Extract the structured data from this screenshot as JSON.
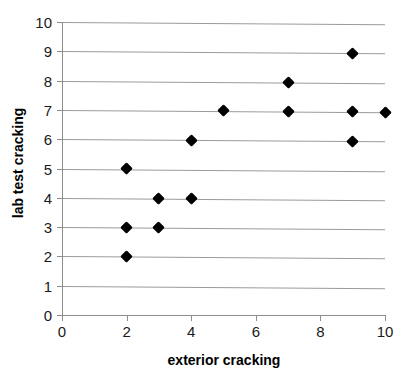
{
  "chart_data": {
    "type": "scatter",
    "title": "",
    "xlabel": "exterior cracking",
    "ylabel": "lab test cracking",
    "xlim": [
      0,
      10
    ],
    "ylim": [
      0,
      10
    ],
    "xticks": [
      0,
      2,
      4,
      6,
      8,
      10
    ],
    "yticks": [
      0,
      1,
      2,
      3,
      4,
      5,
      6,
      7,
      8,
      9,
      10
    ],
    "grid": "horizontal",
    "legend": "none",
    "marker": "diamond",
    "marker_color": "#000000",
    "gridline_color": "#9a9a9a",
    "axis_color": "#8d8d8d",
    "background_color": "#ffffff",
    "points": [
      {
        "x": 2,
        "y": 2
      },
      {
        "x": 2,
        "y": 3
      },
      {
        "x": 3,
        "y": 3
      },
      {
        "x": 3,
        "y": 4
      },
      {
        "x": 4,
        "y": 4
      },
      {
        "x": 2,
        "y": 5
      },
      {
        "x": 4,
        "y": 6
      },
      {
        "x": 9,
        "y": 6
      },
      {
        "x": 5,
        "y": 7
      },
      {
        "x": 7,
        "y": 7
      },
      {
        "x": 9,
        "y": 7
      },
      {
        "x": 10,
        "y": 7
      },
      {
        "x": 7,
        "y": 8
      },
      {
        "x": 9,
        "y": 9
      }
    ]
  }
}
